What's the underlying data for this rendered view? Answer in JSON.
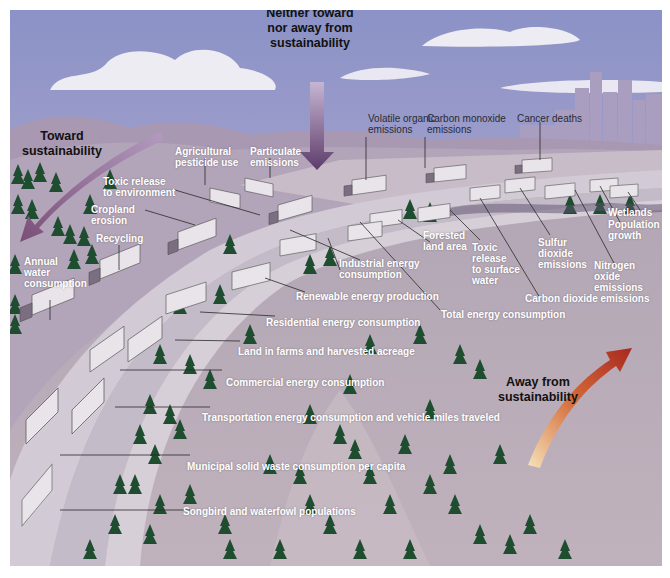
{
  "figure": {
    "type": "illustration"
  },
  "directions": {
    "toward": {
      "label_line1": "Toward",
      "label_line2": "sustainability",
      "arrow_color": "#8a5a7a"
    },
    "neither": {
      "label_line1": "Neither toward",
      "label_line2": "nor away from",
      "label_line3": "sustainability",
      "arrow_color": "#6a4a70"
    },
    "away": {
      "label_line1": "Away from",
      "label_line2": "sustainability",
      "arrow_color": "#b8322a"
    }
  },
  "indicators": {
    "neither_group": [
      {
        "line1": "Volatile organic",
        "line2": "emissions"
      },
      {
        "line1": "Carbon monoxide",
        "line2": "emissions"
      },
      {
        "line1": "Cancer deaths"
      }
    ],
    "toward_group": [
      {
        "line1": "Agricultural",
        "line2": "pesticide use"
      },
      {
        "line1": "Particulate",
        "line2": "emissions"
      },
      {
        "line1": "Toxic release",
        "line2": "to environment"
      },
      {
        "line1": "Cropland",
        "line2": "erosion"
      },
      {
        "line1": "Recycling"
      },
      {
        "line1": "Annual",
        "line2": "water",
        "line3": "consumption"
      }
    ],
    "away_group": [
      {
        "line1": "Forested",
        "line2": "land area"
      },
      {
        "line1": "Toxic",
        "line2": "release",
        "line3": "to surface",
        "line4": "water"
      },
      {
        "line1": "Sulfur",
        "line2": "dioxide",
        "line3": "emissions"
      },
      {
        "line1": "Nitrogen",
        "line2": "oxide",
        "line3": "emissions"
      },
      {
        "line1": "Wetlands"
      },
      {
        "line1": "Population",
        "line2": "growth"
      },
      {
        "line1": "Industrial energy",
        "line2": "consumption"
      },
      {
        "line1": "Carbon dioxide emissions"
      },
      {
        "line1": "Total energy consumption"
      },
      {
        "line1": "Renewable energy production"
      },
      {
        "line1": "Residential energy consumption"
      },
      {
        "line1": "Land in farms and harvested acreage"
      },
      {
        "line1": "Commercial energy consumption"
      },
      {
        "line1": "Transportation energy consumption and vehicle miles traveled"
      },
      {
        "line1": "Municipal solid waste consumption per capita"
      },
      {
        "line1": "Songbird and waterfowl populations"
      }
    ]
  },
  "colors": {
    "sky_top": "#8e94c8",
    "sky_bottom": "#c7b7d4",
    "hills": "#9a8aa8",
    "ground": "#b8a8b4",
    "road": "#cfc8d2",
    "tree": "#1e4a2e",
    "city": "#a69ab8"
  }
}
